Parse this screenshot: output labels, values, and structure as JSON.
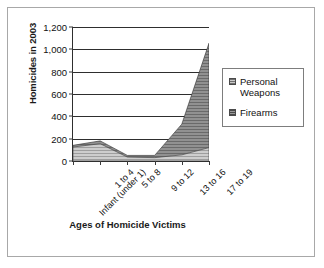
{
  "chart_data": {
    "type": "area",
    "stacked": true,
    "title": "",
    "xlabel": "Ages of Homicide Victims",
    "ylabel": "Homicides in 2003",
    "categories": [
      "Infant (under 1)",
      "1 to 4",
      "5 to 8",
      "9 to 12",
      "13 to 16",
      "17 to 19"
    ],
    "series": [
      {
        "name": "Personal Weapons",
        "values": [
          125,
          155,
          35,
          30,
          55,
          120
        ]
      },
      {
        "name": "Firearms",
        "values": [
          15,
          25,
          15,
          20,
          275,
          935
        ]
      }
    ],
    "totals": [
      140,
      180,
      50,
      50,
      330,
      1055
    ],
    "ylim": [
      0,
      1200
    ],
    "yticks": [
      0,
      200,
      400,
      600,
      800,
      1000,
      1200
    ],
    "ytick_labels": [
      "0",
      "200",
      "400",
      "600",
      "800",
      "1,000",
      "1,200"
    ],
    "grid": "horizontal",
    "legend_position": "right",
    "colors": {
      "personal_weapons": "#c9c9c9",
      "firearms": "#8a8a8a",
      "axis": "#2e2e2e",
      "gridline": "#2e2e2e",
      "frame_border": "#a8a8a8",
      "legend_border": "#7d7d7d",
      "text": "#111111"
    }
  },
  "legend": {
    "items": [
      {
        "label": "Personal Weapons",
        "swatch": "personal-weapons-swatch"
      },
      {
        "label": "Firearms",
        "swatch": "firearms-swatch"
      }
    ]
  }
}
